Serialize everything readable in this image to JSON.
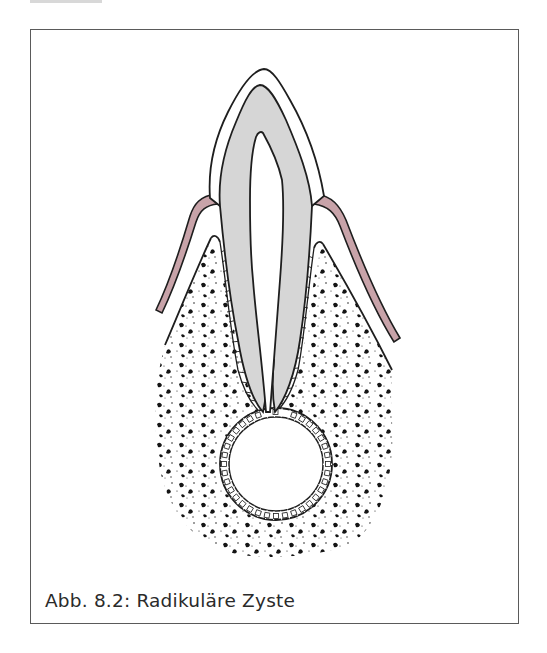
{
  "figure": {
    "caption": "Abb. 8.2: Radikuläre Zyste",
    "colors": {
      "gingiva": "#c8a3a9",
      "dentin": "#d6d6d6",
      "outline": "#1e1e1e",
      "frame": "#5a5a5a",
      "background": "#ffffff"
    },
    "structures": [
      "enamel",
      "dentin",
      "pulp",
      "gingiva",
      "periodontal-ligament",
      "alveolar-bone",
      "cyst-epithelium",
      "cyst-lumen"
    ]
  }
}
